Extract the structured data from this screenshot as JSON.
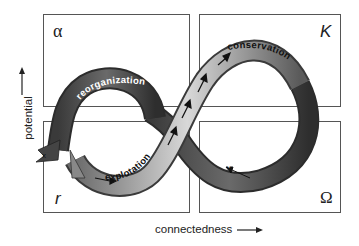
{
  "diagram": {
    "type": "adaptive-cycle",
    "quadrants": [
      {
        "id": "top-left",
        "symbol": "α"
      },
      {
        "id": "top-right",
        "symbol": "K"
      },
      {
        "id": "bottom-left",
        "symbol": "r"
      },
      {
        "id": "bottom-right",
        "symbol": "Ω"
      }
    ],
    "phases": [
      {
        "label": "reorganization",
        "shade": "dark"
      },
      {
        "label": "conservation",
        "shade": "light"
      },
      {
        "label": "explotation",
        "shade": "light"
      },
      {
        "label": "release",
        "shade": "dark"
      }
    ],
    "exit_marker": "x",
    "axes": {
      "x_label": "connectedness",
      "y_label": "potential"
    }
  }
}
